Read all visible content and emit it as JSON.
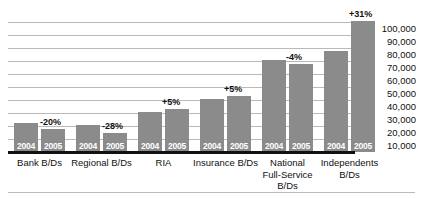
{
  "chart_data": {
    "type": "bar",
    "title": "",
    "subtitle": "",
    "xlabel": "",
    "ylabel": "",
    "ylim": [
      0,
      100000
    ],
    "grid": true,
    "legend": "none",
    "y_ticks": [
      "10,000",
      "20,000",
      "30,000",
      "40,000",
      "50,000",
      "60,000",
      "70,000",
      "80,000",
      "90,000",
      "100,000"
    ],
    "y_tick_values": [
      10000,
      20000,
      30000,
      40000,
      50000,
      60000,
      70000,
      80000,
      90000,
      100000
    ],
    "categories": [
      "Bank B/Ds",
      "Regional B/Ds",
      "RIA",
      "Insurance B/Ds",
      "National Full-Service B/Ds",
      "Independents B/Ds"
    ],
    "category_lines": [
      [
        "Bank B/Ds"
      ],
      [
        "Regional B/Ds"
      ],
      [
        "RIA"
      ],
      [
        "Insurance B/Ds"
      ],
      [
        "National",
        "Full-Service",
        "B/Ds"
      ],
      [
        "Independents",
        "B/Ds"
      ]
    ],
    "series": [
      {
        "name": "2004",
        "values": [
          22000,
          21000,
          31000,
          41000,
          71000,
          78000
        ]
      },
      {
        "name": "2005",
        "values": [
          17500,
          15000,
          33000,
          43000,
          68000,
          101000
        ]
      }
    ],
    "annotations": [
      "-20%",
      "-28%",
      "+5%",
      "+5%",
      "-4%",
      "+31%"
    ],
    "bar_labels": [
      "2004",
      "2005"
    ],
    "colors": {
      "bar": "#8b8b8b",
      "bar_label_text": "#ffffff",
      "gridline": "#b9b9b9",
      "baseline": "#111111",
      "axis_text": "#111111",
      "background": "#ffffff"
    }
  }
}
